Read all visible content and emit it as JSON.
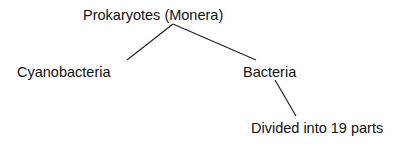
{
  "diagram": {
    "type": "tree",
    "root": {
      "label": "Prokaryotes (Monera)"
    },
    "children": [
      {
        "label": "Cyanobacteria"
      },
      {
        "label": "Bacteria",
        "children": [
          {
            "label": "Divided into 19 parts"
          }
        ]
      }
    ],
    "line_color": "#222222"
  }
}
